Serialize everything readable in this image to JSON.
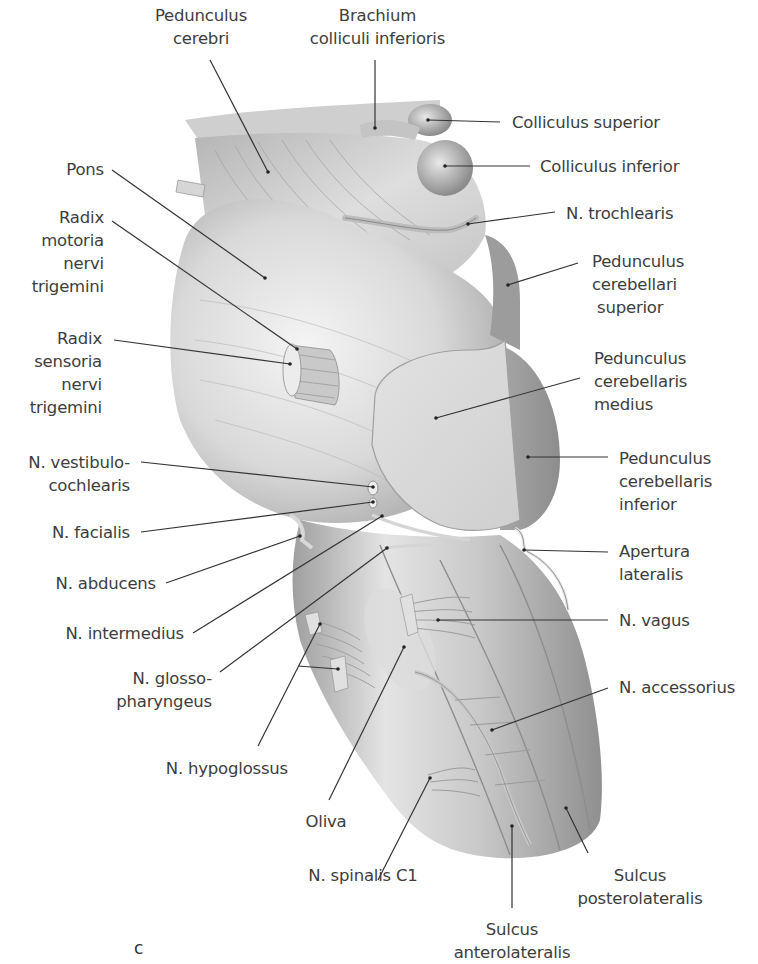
{
  "figure": {
    "panel_letter": "c",
    "colors": {
      "background": "#ffffff",
      "text": "#3d3d3d",
      "leader_line": "#333333",
      "tissue_light": "#e6e6e6",
      "tissue_mid": "#bdbdbd",
      "tissue_dark": "#8a8a8a"
    }
  },
  "labels": {
    "pedunculus_cerebri": [
      "Pedunculus",
      "cerebri"
    ],
    "brachium_colliculi_inferioris": [
      "Brachium",
      "colliculi inferioris"
    ],
    "colliculus_superior": [
      "Colliculus superior"
    ],
    "colliculus_inferior": [
      "Colliculus inferior"
    ],
    "n_trochlearis": [
      "N. trochlearis"
    ],
    "pedunculus_cerebellari_superior": [
      "Pedunculus",
      "cerebellari",
      "superior"
    ],
    "pons": [
      "Pons"
    ],
    "radix_motoria": [
      "Radix",
      "motoria",
      "nervi",
      "trigemini"
    ],
    "radix_sensoria": [
      "Radix",
      "sensoria",
      "nervi",
      "trigemini"
    ],
    "pedunculus_cerebellaris_medius": [
      "Pedunculus",
      "cerebellaris",
      "medius"
    ],
    "pedunculus_cerebellaris_inferior": [
      "Pedunculus",
      "cerebellaris",
      "inferior"
    ],
    "n_vestibulocochlearis": [
      "N. vestibulo-",
      "cochlearis"
    ],
    "n_facialis": [
      "N. facialis"
    ],
    "n_abducens": [
      "N. abducens"
    ],
    "apertura_lateralis": [
      "Apertura",
      "lateralis"
    ],
    "n_intermedius": [
      "N. intermedius"
    ],
    "n_vagus": [
      "N. vagus"
    ],
    "n_glossopharyngeus": [
      "N. glosso-",
      "pharyngeus"
    ],
    "n_accessorius": [
      "N. accessorius"
    ],
    "n_hypoglossus": [
      "N. hypoglossus"
    ],
    "oliva": [
      "Oliva"
    ],
    "n_spinalis_c1": [
      "N. spinalis C1"
    ],
    "sulcus_posterolateralis": [
      "Sulcus",
      "posterolateralis"
    ],
    "sulcus_anterolateralis": [
      "Sulcus",
      "anterolateralis"
    ]
  }
}
